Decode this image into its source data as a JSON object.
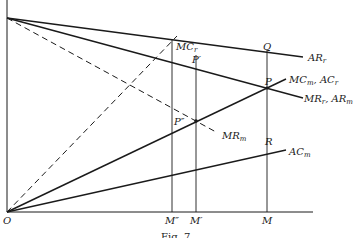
{
  "figure": {
    "caption": "Fig. 7",
    "origin_label": "O",
    "colors": {
      "line": "#1a1a1a",
      "background": "#ffffff"
    }
  },
  "curves": [
    {
      "id": "AR_r",
      "label_main": "AR",
      "label_sub": "r",
      "style": "solid"
    },
    {
      "id": "MR_r_AR_m",
      "label_main": "MR",
      "label_sub": "r",
      "label_main2": ", AR",
      "label_sub2": "m",
      "style": "solid"
    },
    {
      "id": "MR_m",
      "label_main": "MR",
      "label_sub": "m",
      "style": "dashed"
    },
    {
      "id": "MC_r",
      "label_main": "MC",
      "label_sub": "r",
      "style": "dashed"
    },
    {
      "id": "MC_m_AC_r",
      "label_main": "MC",
      "label_sub": "m",
      "label_main2": ", AC",
      "label_sub2": "r",
      "style": "solid"
    },
    {
      "id": "AC_m",
      "label_main": "AC",
      "label_sub": "m",
      "style": "solid"
    }
  ],
  "points": {
    "Q": "Q",
    "P": "P",
    "R": "R",
    "P_prime": "P′",
    "P_double_prime": "P″"
  },
  "x_axis_labels": {
    "M_double_prime": "M″",
    "M_prime": "M′",
    "M": "M"
  }
}
